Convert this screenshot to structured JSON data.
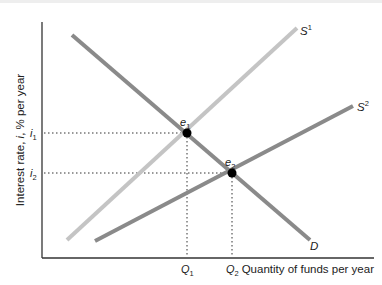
{
  "diagram": {
    "y_axis_label": "Interest rate, i, % per year",
    "y_axis_label_parts": [
      "Interest rate, ",
      "i",
      ", % per year"
    ],
    "x_axis_label": "Quantity of funds per year",
    "y_ticks": [
      {
        "base": "i",
        "sub": "1"
      },
      {
        "base": "i",
        "sub": "2"
      }
    ],
    "x_ticks": [
      {
        "base": "Q",
        "sub": "1"
      },
      {
        "base": "Q",
        "sub": "2"
      }
    ],
    "curves": [
      {
        "name": "D",
        "label": "D",
        "sup": "",
        "color": "#8a8a8a"
      },
      {
        "name": "S1",
        "label": "S",
        "sup": "1",
        "color": "#c4c4c4"
      },
      {
        "name": "S2",
        "label": "S",
        "sup": "2",
        "color": "#8a8a8a"
      }
    ],
    "equilibria": [
      {
        "base": "e",
        "sub": "1"
      },
      {
        "base": "e",
        "sub": "2"
      }
    ]
  },
  "colors": {
    "axis": "#333333",
    "demand": "#8a8a8a",
    "supply1": "#c4c4c4",
    "supply2": "#8a8a8a",
    "point": "#000000",
    "guide": "#333333"
  }
}
